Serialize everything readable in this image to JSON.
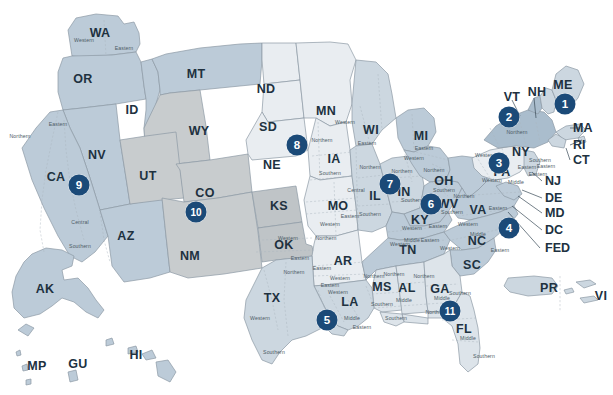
{
  "map": {
    "title": "United States Federal Judicial Circuits",
    "colors": {
      "badge": "#1b4a78",
      "label_text": "#20313f",
      "district_text": "#4c5b66",
      "border": "#8d9aa5",
      "dashed_border": "#a9b5be",
      "background": "#ffffff",
      "fill_pale": "#e9edf1",
      "fill_light": "#dde4ea",
      "fill_mid": "#ccd7e0",
      "fill_medium": "#bccbd8",
      "fill_deep": "#aabdcd",
      "fill_gray": "#c8ccce",
      "fill_gray_dark": "#bfc4c7"
    },
    "states": [
      {
        "code": "WA",
        "x": 100,
        "y": 33
      },
      {
        "code": "OR",
        "x": 83,
        "y": 79
      },
      {
        "code": "ID",
        "x": 132,
        "y": 110
      },
      {
        "code": "MT",
        "x": 196,
        "y": 74
      },
      {
        "code": "ND",
        "x": 266,
        "y": 89
      },
      {
        "code": "SD",
        "x": 268,
        "y": 127
      },
      {
        "code": "NE",
        "x": 272,
        "y": 165
      },
      {
        "code": "MN",
        "x": 326,
        "y": 111
      },
      {
        "code": "WY",
        "x": 199,
        "y": 131
      },
      {
        "code": "NV",
        "x": 97,
        "y": 155
      },
      {
        "code": "UT",
        "x": 148,
        "y": 176
      },
      {
        "code": "CO",
        "x": 205,
        "y": 193
      },
      {
        "code": "KS",
        "x": 279,
        "y": 206
      },
      {
        "code": "CA",
        "x": 56,
        "y": 177
      },
      {
        "code": "AZ",
        "x": 126,
        "y": 236
      },
      {
        "code": "NM",
        "x": 190,
        "y": 256
      },
      {
        "code": "OK",
        "x": 284,
        "y": 245
      },
      {
        "code": "TX",
        "x": 272,
        "y": 298
      },
      {
        "code": "IA",
        "x": 334,
        "y": 159
      },
      {
        "code": "MO",
        "x": 338,
        "y": 206
      },
      {
        "code": "AR",
        "x": 343,
        "y": 261
      },
      {
        "code": "LA",
        "x": 350,
        "y": 302
      },
      {
        "code": "WI",
        "x": 371,
        "y": 130
      },
      {
        "code": "IL",
        "x": 375,
        "y": 196
      },
      {
        "code": "MS",
        "x": 382,
        "y": 287
      },
      {
        "code": "MI",
        "x": 421,
        "y": 136
      },
      {
        "code": "IN",
        "x": 404,
        "y": 192
      },
      {
        "code": "KY",
        "x": 420,
        "y": 220
      },
      {
        "code": "TN",
        "x": 408,
        "y": 250
      },
      {
        "code": "AL",
        "x": 407,
        "y": 288
      },
      {
        "code": "GA",
        "x": 440,
        "y": 289
      },
      {
        "code": "OH",
        "x": 444,
        "y": 181
      },
      {
        "code": "WV",
        "x": 448,
        "y": 204
      },
      {
        "code": "VA",
        "x": 478,
        "y": 210
      },
      {
        "code": "NC",
        "x": 477,
        "y": 241
      },
      {
        "code": "SC",
        "x": 472,
        "y": 265
      },
      {
        "code": "FL",
        "x": 464,
        "y": 329
      },
      {
        "code": "PA",
        "x": 502,
        "y": 172
      },
      {
        "code": "NY",
        "x": 521,
        "y": 152
      },
      {
        "code": "VT",
        "x": 512,
        "y": 97
      },
      {
        "code": "NH",
        "x": 537,
        "y": 92
      },
      {
        "code": "ME",
        "x": 563,
        "y": 85
      },
      {
        "code": "AK",
        "x": 45,
        "y": 289
      },
      {
        "code": "HI",
        "x": 136,
        "y": 355
      },
      {
        "code": "MP",
        "x": 37,
        "y": 366
      },
      {
        "code": "GU",
        "x": 78,
        "y": 364
      },
      {
        "code": "PR",
        "x": 549,
        "y": 288
      },
      {
        "code": "VI",
        "x": 601,
        "y": 296
      }
    ],
    "callouts": [
      {
        "label": "MA",
        "x": 573,
        "y": 128
      },
      {
        "label": "RI",
        "x": 573,
        "y": 145
      },
      {
        "label": "CT",
        "x": 573,
        "y": 160
      },
      {
        "label": "NJ",
        "x": 545,
        "y": 181
      },
      {
        "label": "DE",
        "x": 545,
        "y": 198
      },
      {
        "label": "MD",
        "x": 545,
        "y": 213
      },
      {
        "label": "DC",
        "x": 545,
        "y": 230
      },
      {
        "label": "FED",
        "x": 545,
        "y": 248
      }
    ],
    "districts": [
      {
        "label": "Western",
        "x": 84,
        "y": 40
      },
      {
        "label": "Eastern",
        "x": 124,
        "y": 48
      },
      {
        "label": "Eastern",
        "x": 58,
        "y": 124
      },
      {
        "label": "Northern",
        "x": 20,
        "y": 136
      },
      {
        "label": "Central",
        "x": 80,
        "y": 222
      },
      {
        "label": "Southern",
        "x": 80,
        "y": 246
      },
      {
        "label": "Western",
        "x": 345,
        "y": 122
      },
      {
        "label": "Eastern",
        "x": 367,
        "y": 143
      },
      {
        "label": "Northern",
        "x": 322,
        "y": 140
      },
      {
        "label": "Southern",
        "x": 330,
        "y": 173
      },
      {
        "label": "Northern",
        "x": 370,
        "y": 167
      },
      {
        "label": "Central",
        "x": 356,
        "y": 190
      },
      {
        "label": "Southern",
        "x": 370,
        "y": 214
      },
      {
        "label": "Eastern",
        "x": 350,
        "y": 216
      },
      {
        "label": "Western",
        "x": 330,
        "y": 224
      },
      {
        "label": "Eastern",
        "x": 300,
        "y": 258
      },
      {
        "label": "Western",
        "x": 288,
        "y": 238
      },
      {
        "label": "Northern",
        "x": 326,
        "y": 238
      },
      {
        "label": "Northern",
        "x": 294,
        "y": 272
      },
      {
        "label": "Eastern",
        "x": 330,
        "y": 285
      },
      {
        "label": "Western",
        "x": 260,
        "y": 318
      },
      {
        "label": "Southern",
        "x": 274,
        "y": 352
      },
      {
        "label": "Eastern",
        "x": 322,
        "y": 268
      },
      {
        "label": "Western",
        "x": 340,
        "y": 278
      },
      {
        "label": "Western",
        "x": 338,
        "y": 292
      },
      {
        "label": "Middle",
        "x": 352,
        "y": 318
      },
      {
        "label": "Eastern",
        "x": 362,
        "y": 327
      },
      {
        "label": "Northern",
        "x": 374,
        "y": 276
      },
      {
        "label": "Southern",
        "x": 382,
        "y": 304
      },
      {
        "label": "Northern",
        "x": 394,
        "y": 274
      },
      {
        "label": "Middle",
        "x": 404,
        "y": 300
      },
      {
        "label": "Southern",
        "x": 396,
        "y": 318
      },
      {
        "label": "Northern",
        "x": 424,
        "y": 276
      },
      {
        "label": "Middle",
        "x": 442,
        "y": 298
      },
      {
        "label": "Southern",
        "x": 460,
        "y": 293
      },
      {
        "label": "Northern",
        "x": 436,
        "y": 312
      },
      {
        "label": "Middle",
        "x": 468,
        "y": 338
      },
      {
        "label": "Southern",
        "x": 484,
        "y": 356
      },
      {
        "label": "Eastern",
        "x": 424,
        "y": 148
      },
      {
        "label": "Western",
        "x": 414,
        "y": 158
      },
      {
        "label": "Northern",
        "x": 402,
        "y": 171
      },
      {
        "label": "Southern",
        "x": 412,
        "y": 200
      },
      {
        "label": "Northern",
        "x": 434,
        "y": 170
      },
      {
        "label": "Southern",
        "x": 444,
        "y": 190
      },
      {
        "label": "Western",
        "x": 412,
        "y": 228
      },
      {
        "label": "Eastern",
        "x": 438,
        "y": 226
      },
      {
        "label": "Middle",
        "x": 412,
        "y": 240
      },
      {
        "label": "Eastern",
        "x": 430,
        "y": 240
      },
      {
        "label": "Western",
        "x": 400,
        "y": 244
      },
      {
        "label": "Northern",
        "x": 464,
        "y": 196
      },
      {
        "label": "Southern",
        "x": 452,
        "y": 212
      },
      {
        "label": "Eastern",
        "x": 498,
        "y": 208
      },
      {
        "label": "Western",
        "x": 468,
        "y": 224
      },
      {
        "label": "Middle",
        "x": 478,
        "y": 234
      },
      {
        "label": "Western",
        "x": 450,
        "y": 248
      },
      {
        "label": "Eastern",
        "x": 500,
        "y": 250
      },
      {
        "label": "Northern",
        "x": 517,
        "y": 132
      },
      {
        "label": "Western",
        "x": 485,
        "y": 155
      },
      {
        "label": "Southern",
        "x": 540,
        "y": 160
      },
      {
        "label": "Eastern",
        "x": 546,
        "y": 166
      },
      {
        "label": "Western",
        "x": 492,
        "y": 180
      },
      {
        "label": "Middle",
        "x": 516,
        "y": 182
      },
      {
        "label": "Eastern",
        "x": 538,
        "y": 174
      },
      {
        "label": "Eastern",
        "x": 527,
        "y": 167
      }
    ],
    "circuits": [
      {
        "number": "1",
        "x": 565,
        "y": 104
      },
      {
        "number": "2",
        "x": 509,
        "y": 117
      },
      {
        "number": "3",
        "x": 499,
        "y": 163
      },
      {
        "number": "4",
        "x": 509,
        "y": 228
      },
      {
        "number": "5",
        "x": 327,
        "y": 320
      },
      {
        "number": "6",
        "x": 431,
        "y": 204
      },
      {
        "number": "7",
        "x": 390,
        "y": 184
      },
      {
        "number": "8",
        "x": 297,
        "y": 145
      },
      {
        "number": "9",
        "x": 79,
        "y": 185
      },
      {
        "number": "10",
        "x": 196,
        "y": 212
      },
      {
        "number": "11",
        "x": 450,
        "y": 311
      }
    ]
  }
}
